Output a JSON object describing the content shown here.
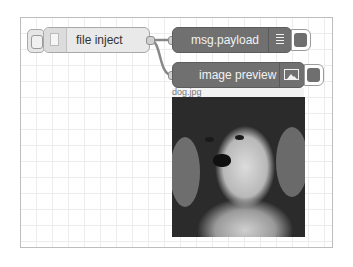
{
  "workspace": {
    "grid": true,
    "background_color": "#ffffff",
    "grid_color": "#ececec"
  },
  "nodes": {
    "file_inject": {
      "label": "file inject",
      "icon": "file-icon",
      "color": "#e9e9e9",
      "has_inject_button": true
    },
    "msg_payload": {
      "label": "msg.payload",
      "icon": "list-icon",
      "color": "#707070",
      "has_side_button": true
    },
    "image_preview": {
      "label": "image preview",
      "icon": "image-icon",
      "color": "#707070",
      "has_side_button": true,
      "caption": "dog.jpg",
      "preview_content": "grayscale photo of a puppy"
    }
  },
  "wires": [
    {
      "from": "file_inject",
      "to": "msg_payload"
    },
    {
      "from": "file_inject",
      "to": "image_preview"
    }
  ]
}
